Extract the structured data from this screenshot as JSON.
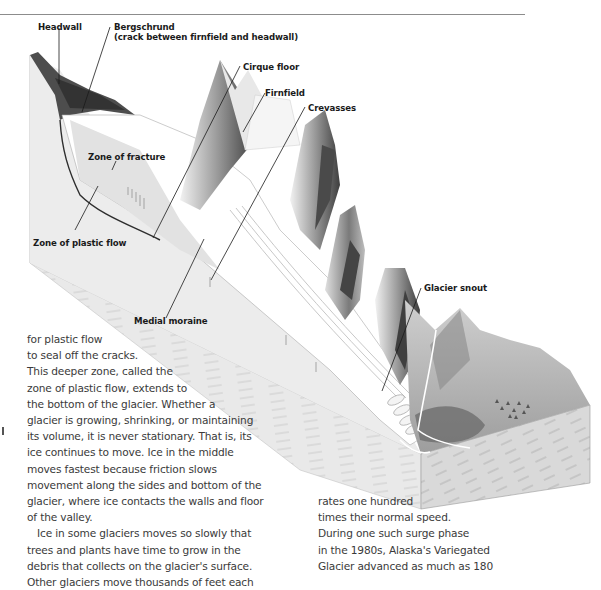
{
  "figure": {
    "labels": {
      "headwall": "Headwall",
      "bergschrund_line1": "Bergschrund",
      "bergschrund_line2": "(crack between firnfield and headwall)",
      "cirque_floor": "Cirque floor",
      "firnfield": "Firnfield",
      "crevasses": "Crevasses",
      "zone_of_fracture": "Zone of fracture",
      "zone_of_plastic_flow": "Zone of plastic flow",
      "medial_moraine": "Medial moraine",
      "glacier_snout": "Glacier snout"
    },
    "colors": {
      "rock_face": "#e6e6e6",
      "dark_rock": "#4a4a4a",
      "ice": "#ffffff",
      "leader_line": "#1a1a1a",
      "rule": "#8c8c8c"
    }
  },
  "column_left": {
    "lines": [
      "for plastic flow",
      "to seal off the cracks.",
      "This deeper zone, called the",
      "zone of plastic flow, extends to",
      "the bottom of the glacier. Whether a",
      "glacier is growing, shrinking, or maintaining",
      "its volume, it is never stationary. That is, its",
      "ice continues to move. Ice in the middle",
      "moves fastest because friction slows",
      "movement along the sides and bottom of the",
      "glacier, where ice contacts the walls and floor",
      "of the valley.",
      "Ice in some glaciers moves so slowly that",
      "trees and plants have time to grow in the",
      "debris that collects on the glacier's surface.",
      "Other glaciers move thousands of feet each"
    ]
  },
  "column_right": {
    "lines": [
      "rates one hundred",
      "times their normal speed.",
      "During one such surge phase",
      "in the 1980s, Alaska's Variegated",
      "Glacier advanced as much as 180"
    ]
  }
}
